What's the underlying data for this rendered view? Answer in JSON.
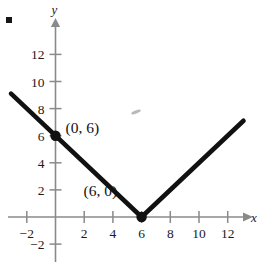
{
  "figure": {
    "name": "absolute-value-graph",
    "corner_bullet": "•"
  },
  "chart_data": {
    "type": "line",
    "title": "",
    "xlabel": "x",
    "ylabel": "y",
    "xlim": [
      -3.8,
      14.4
    ],
    "ylim": [
      -3.7,
      13.6
    ],
    "grid": false,
    "legend": null,
    "equation": "y = |x - 6|",
    "series": [
      {
        "name": "y = |x - 6|",
        "points": [
          {
            "x": -3.1,
            "y": 9.1
          },
          {
            "x": 6,
            "y": 0
          },
          {
            "x": 13.1,
            "y": 7.1
          }
        ],
        "color": "#111111"
      }
    ],
    "annotated_points": [
      {
        "x": 0,
        "y": 6,
        "label": "(0, 6)",
        "label_dx": 10,
        "label_dy": -3
      },
      {
        "x": 6,
        "y": 0,
        "label": "(6, 0)",
        "label_dx": -58,
        "label_dy": -21
      }
    ],
    "x_ticks": [
      {
        "value": -2,
        "label": "-2"
      },
      {
        "value": 2,
        "label": "2"
      },
      {
        "value": 4,
        "label": "4"
      },
      {
        "value": 6,
        "label": "6"
      },
      {
        "value": 8,
        "label": "8"
      },
      {
        "value": 10,
        "label": "10"
      },
      {
        "value": 12,
        "label": "12"
      }
    ],
    "y_ticks": [
      {
        "value": 12,
        "label": "12"
      },
      {
        "value": 10,
        "label": "10"
      },
      {
        "value": 8,
        "label": "8"
      },
      {
        "value": 6,
        "label": "6"
      },
      {
        "value": 4,
        "label": "4"
      },
      {
        "value": 2,
        "label": "2"
      },
      {
        "value": -2,
        "label": "-2"
      }
    ],
    "axis_color": "#8a8a8a",
    "curve_color": "#111111"
  }
}
